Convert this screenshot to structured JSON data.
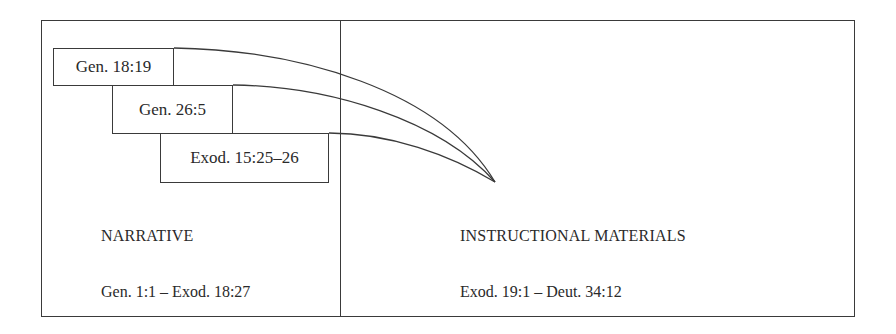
{
  "diagram": {
    "references": [
      {
        "label": "Gen. 18:19"
      },
      {
        "label": "Gen. 26:5"
      },
      {
        "label": "Exod. 15:25–26"
      }
    ],
    "sections": [
      {
        "title": "NARRATIVE",
        "range": "Gen. 1:1 – Exod. 18:27"
      },
      {
        "title": "INSTRUCTIONAL MATERIALS",
        "range": "Exod. 19:1 – Deut. 34:12"
      }
    ],
    "line_color": "#3a3a3a"
  }
}
